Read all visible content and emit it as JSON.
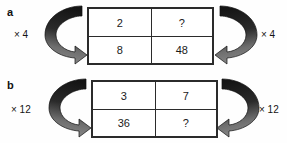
{
  "figure": {
    "background_color": "#ffffff",
    "border_color": "#2b2b2b",
    "text_color": "#1a1a1a",
    "arrow_dark_color": "#1c1c1c",
    "arrow_light_color": "#8a8a8a"
  },
  "panels": [
    {
      "letter": "a",
      "multiplier_left": "× 4",
      "multiplier_right": "× 4",
      "arrow_left_name": "curved-arrow-left-clockwise-icon",
      "arrow_right_name": "curved-arrow-right-counterclockwise-icon",
      "table": {
        "rows": [
          [
            "2",
            "?"
          ],
          [
            "8",
            "48"
          ]
        ]
      }
    },
    {
      "letter": "b",
      "multiplier_left": "× 12",
      "multiplier_right": "× 12",
      "arrow_left_name": "curved-arrow-left-clockwise-icon",
      "arrow_right_name": "curved-arrow-right-counterclockwise-icon",
      "table": {
        "rows": [
          [
            "3",
            "7"
          ],
          [
            "36",
            "?"
          ]
        ]
      }
    }
  ]
}
